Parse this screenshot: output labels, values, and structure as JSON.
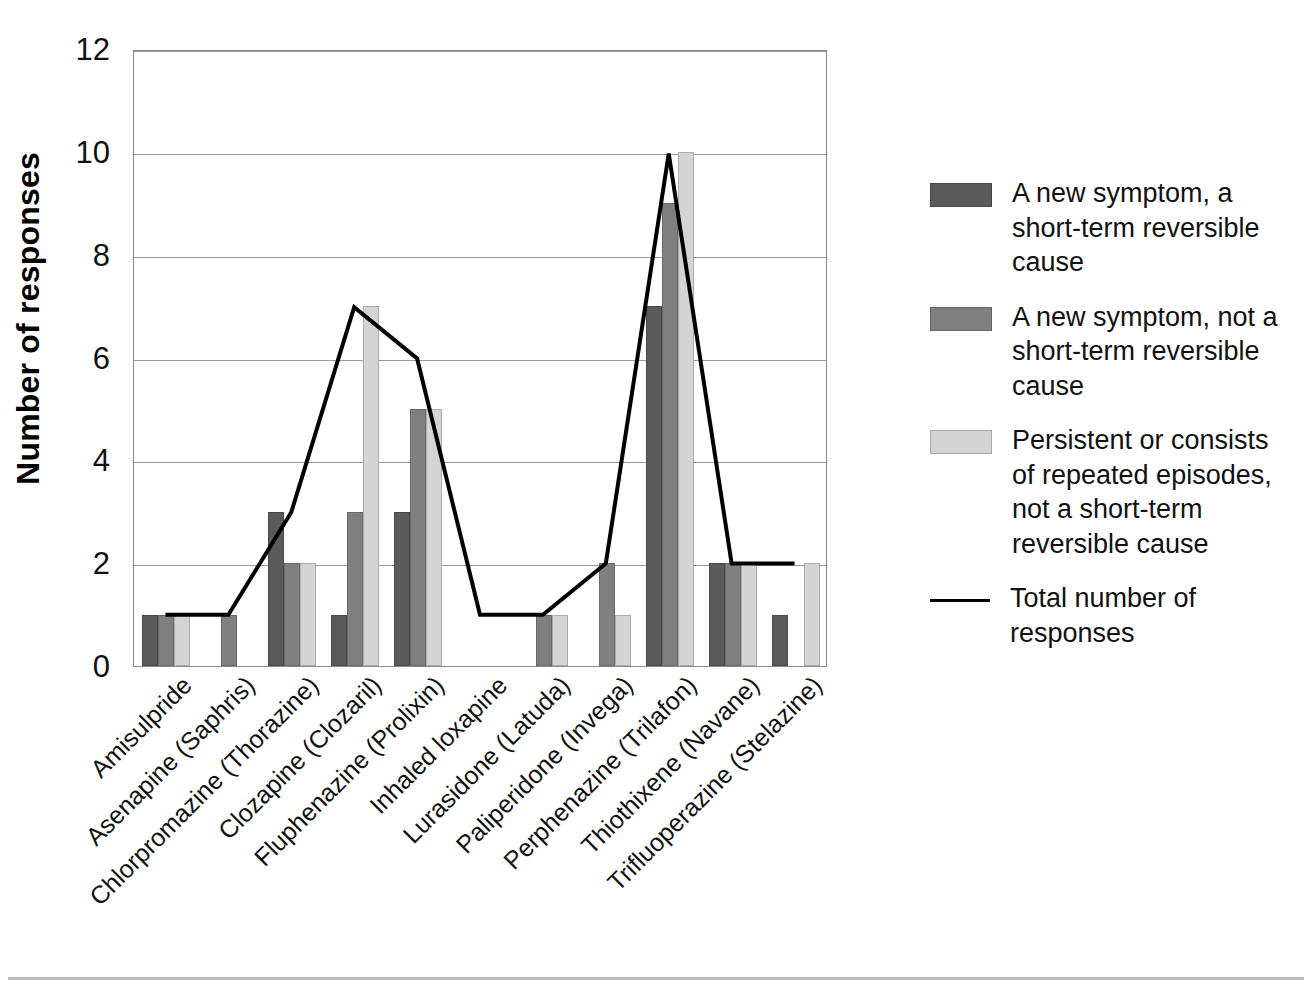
{
  "chart_data": {
    "type": "bar",
    "title": "",
    "subtitle": "",
    "xlabel": "",
    "ylabel": "Number of responses",
    "ylim": [
      0,
      12
    ],
    "ytick_step": 2,
    "yticks": [
      0,
      2,
      4,
      6,
      8,
      10,
      12
    ],
    "grid": true,
    "legend_position": "right",
    "categories": [
      "Amisulpride",
      "Asenapine (Saphris)",
      "Chlorpromazine (Thorazine)",
      "Clozapine (Clozaril)",
      "Fluphenazine (Prolixin)",
      "Inhaled loxapine",
      "Lurasidone (Latuda)",
      "Paliperidone (Invega)",
      "Perphenazine (Trilafon)",
      "Thiothixene (Navane)",
      "Trifluoperazine (Stelazine)"
    ],
    "series": [
      {
        "name": "A new symptom, a short-term reversible cause",
        "type": "bar",
        "color": "#5a5a5a",
        "values": [
          1,
          0,
          3,
          1,
          3,
          0,
          0,
          0,
          7,
          2,
          1
        ]
      },
      {
        "name": "A new symptom, not a short-term reversible cause",
        "type": "bar",
        "color": "#808080",
        "values": [
          1,
          1,
          2,
          3,
          5,
          0,
          1,
          2,
          9,
          2,
          0
        ]
      },
      {
        "name": "Persistent or consists of repeated episodes, not a short-term reversible cause",
        "type": "bar",
        "color": "#d4d4d4",
        "values": [
          1,
          0,
          2,
          7,
          5,
          0,
          1,
          1,
          10,
          2,
          2
        ]
      },
      {
        "name": "Total number of responses",
        "type": "line",
        "color": "#000000",
        "values": [
          1,
          1,
          3,
          7,
          6,
          1,
          1,
          2,
          10,
          2,
          2
        ]
      }
    ]
  },
  "legend": {
    "items": [
      {
        "label": "A new symptom, a short-term reversible cause",
        "marker": "swatch-dark"
      },
      {
        "label": "A new symptom, not a short-term reversible cause",
        "marker": "swatch-medium"
      },
      {
        "label": "Persistent or consists of repeated episodes, not a short-term reversible cause",
        "marker": "swatch-light"
      },
      {
        "label": "Total number of responses",
        "marker": "line"
      }
    ]
  },
  "axes": {
    "y_title": "Number of responses",
    "y_tick_labels": [
      "12",
      "10",
      "8",
      "6",
      "4",
      "2",
      "0"
    ]
  },
  "colors": {
    "series_dark": "#5a5a5a",
    "series_medium": "#808080",
    "series_light": "#d4d4d4",
    "line": "#000000",
    "grid": "#9a9a9a",
    "axis": "#8a8a8a"
  }
}
